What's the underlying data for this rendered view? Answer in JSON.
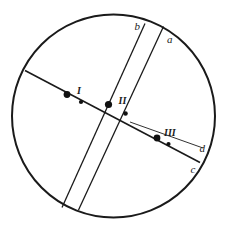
{
  "figure": {
    "width": 228,
    "height": 231,
    "background_color": "#ffffff",
    "stroke_color": "#1a1a1a"
  },
  "circle": {
    "name": "outer-circle",
    "cx": 113.5,
    "cy": 116,
    "r": 101.5,
    "stroke_width": 2.0
  },
  "lines": [
    {
      "id": "chord-main",
      "label": "",
      "x1": 25.0,
      "y1": 70.5,
      "x2": 200.0,
      "y2": 162.5,
      "stroke_width": 1.6
    },
    {
      "id": "band-line-b",
      "label": "b",
      "x1": 145.0,
      "y1": 23.5,
      "x2": 62.0,
      "y2": 207.5,
      "stroke_width": 1.3
    },
    {
      "id": "band-line-a",
      "label": "a",
      "x1": 163.5,
      "y1": 26.5,
      "x2": 78.5,
      "y2": 210.0,
      "stroke_width": 1.3
    },
    {
      "id": "thin-line-d",
      "label": "d",
      "x1": 130.0,
      "y1": 122.0,
      "x2": 203.0,
      "y2": 148.0,
      "stroke_width": 0.9
    }
  ],
  "labels": [
    {
      "id": "label-b",
      "text": "b",
      "x": 134.5,
      "y": 29.5,
      "style": "lower"
    },
    {
      "id": "label-a",
      "text": "a",
      "x": 167.0,
      "y": 43.0,
      "style": "lower"
    },
    {
      "id": "label-d",
      "text": "d",
      "x": 199.5,
      "y": 152.0,
      "style": "lower"
    },
    {
      "id": "label-c",
      "text": "c",
      "x": 190.5,
      "y": 173.0,
      "style": "lower"
    },
    {
      "id": "label-I",
      "text": "I",
      "x": 77.0,
      "y": 94.0,
      "style": "roman"
    },
    {
      "id": "label-II",
      "text": "II",
      "x": 118.5,
      "y": 104.0,
      "style": "roman"
    },
    {
      "id": "label-III",
      "text": "III",
      "x": 164.0,
      "y": 136.0,
      "style": "roman"
    }
  ],
  "points": [
    {
      "id": "point-I-large",
      "group": "I",
      "cx": 67.0,
      "cy": 94.5,
      "r": 3.4,
      "kind": "large"
    },
    {
      "id": "point-I-small",
      "group": "I",
      "cx": 81.0,
      "cy": 102.0,
      "r": 2.1,
      "kind": "small"
    },
    {
      "id": "point-II-large",
      "group": "II",
      "cx": 108.5,
      "cy": 104.5,
      "r": 3.6,
      "kind": "large"
    },
    {
      "id": "point-II-small",
      "group": "II",
      "cx": 125.5,
      "cy": 113.5,
      "r": 2.3,
      "kind": "small"
    },
    {
      "id": "point-III-large",
      "group": "III",
      "cx": 157.0,
      "cy": 138.0,
      "r": 3.4,
      "kind": "large"
    },
    {
      "id": "point-III-small",
      "group": "III",
      "cx": 168.5,
      "cy": 144.0,
      "r": 2.1,
      "kind": "small"
    }
  ]
}
